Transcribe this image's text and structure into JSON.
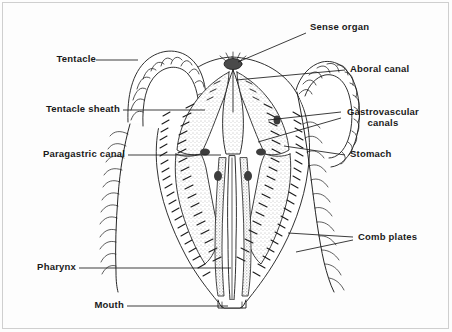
{
  "figure": {
    "background_color": "#fdfdfd",
    "ink_color": "#1a1a1a",
    "stipple_color": "#6d6d6d"
  },
  "labels": {
    "tentacle": "Tentacle",
    "tentacle_sheath": "Tentacle sheath",
    "paragastric_canal": "Paragastric canal",
    "pharynx": "Pharynx",
    "mouth": "Mouth",
    "sense_organ": "Sense organ",
    "aboral_canal": "Aboral canal",
    "gastrovascular_canals_line1": "Gastrovascular",
    "gastrovascular_canals_line2": "canals",
    "stomach": "Stomach",
    "comb_plates": "Comb plates"
  }
}
